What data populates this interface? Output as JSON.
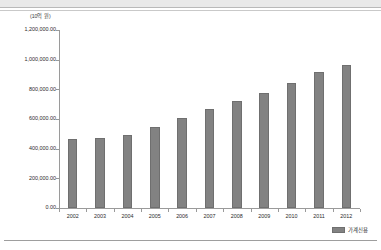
{
  "chart_data": {
    "type": "bar",
    "title": "",
    "subtitle": "",
    "unit_label": "(10억 원)",
    "xlabel": "",
    "ylabel": "",
    "categories": [
      "2002",
      "2003",
      "2004",
      "2005",
      "2006",
      "2007",
      "2008",
      "2009",
      "2010",
      "2011",
      "2012"
    ],
    "series": [
      {
        "name": "가계신용",
        "values": [
          465000,
          472000,
          494000,
          543000,
          607000,
          665000,
          724000,
          775000,
          843000,
          916000,
          964000
        ],
        "color": "#828282"
      }
    ],
    "ylim": [
      0,
      1200000
    ],
    "ytick_values": [
      0,
      200000,
      400000,
      600000,
      800000,
      1000000,
      1200000
    ],
    "ytick_labels": [
      "0.00",
      "200,000.00",
      "400,000.00",
      "600,000.00",
      "800,000.00",
      "1,000,000.00",
      "1,200,000.00"
    ],
    "grid": false,
    "legend_position": "bottom-right"
  },
  "legend": {
    "entries": [
      {
        "label": "가계신용",
        "color": "#828282"
      }
    ]
  },
  "axis": {
    "unit_label": "(10억 원)"
  }
}
